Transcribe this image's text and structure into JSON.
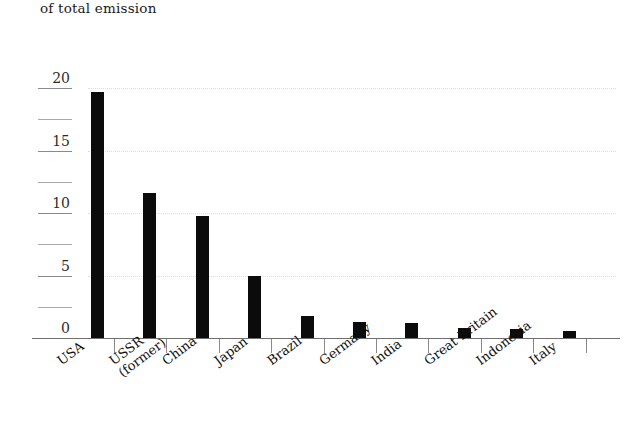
{
  "title": "of total emission",
  "chart_data": {
    "type": "bar",
    "title": "of total emission",
    "xlabel": "",
    "ylabel": "",
    "ylim": [
      0,
      20
    ],
    "grid": true,
    "legend": "none",
    "orientation": "vertical",
    "bar_color": "#0b0b0b",
    "categories": [
      "USA",
      "USSR\n(former)",
      "China",
      "Japan",
      "Brazil",
      "Germany",
      "India",
      "Great Britain",
      "Indonesia",
      "Italy"
    ],
    "values": [
      19.7,
      11.6,
      9.8,
      5.0,
      1.8,
      1.3,
      1.2,
      0.8,
      0.7,
      0.6
    ],
    "yticks": [
      0,
      5,
      10,
      15,
      20
    ],
    "ytick_labels": [
      "0",
      "5",
      "10",
      "15",
      "20"
    ],
    "yticks_minor": [
      2.5,
      7.5,
      12.5,
      17.5
    ],
    "gridlines": [
      5,
      10,
      15,
      20
    ]
  }
}
